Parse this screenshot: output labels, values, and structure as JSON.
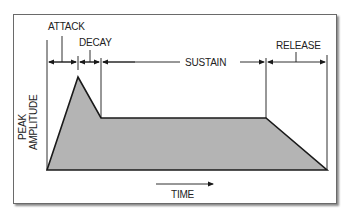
{
  "diagram": {
    "phases": [
      {
        "key": "attack",
        "label": "ATTACK"
      },
      {
        "key": "decay",
        "label": "DECAY"
      },
      {
        "key": "sustain",
        "label": "SUSTAIN"
      },
      {
        "key": "release",
        "label": "RELEASE"
      }
    ],
    "y_axis": {
      "line1": "PEAK",
      "line2": "AMPLITUDE"
    },
    "x_axis": {
      "label": "TIME"
    },
    "colors": {
      "fill": "#b4b4b4",
      "stroke": "#1a1a1a",
      "frame": "#6a6a6a"
    }
  }
}
